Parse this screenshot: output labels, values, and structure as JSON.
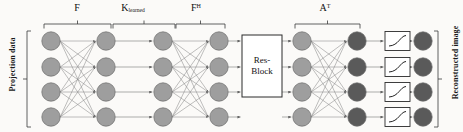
{
  "figure": {
    "type": "neural-network-architecture-diagram",
    "title": "",
    "background_color": "#fbfaf8"
  },
  "side_labels": {
    "left": "Projection data",
    "right": "Reconstructed image"
  },
  "operator_labels": [
    {
      "id": "F",
      "base": "F",
      "sub": "",
      "sup": "",
      "x": 77,
      "bracket_x1": 44,
      "bracket_x2": 111
    },
    {
      "id": "K",
      "base": "K",
      "sub": "learned",
      "sup": "",
      "x": 133,
      "bracket_x1": 113,
      "bracket_x2": 175
    },
    {
      "id": "FH",
      "base": "F",
      "sub": "",
      "sup": "H",
      "x": 196,
      "bracket_x1": 176,
      "bracket_x2": 225
    },
    {
      "id": "AT",
      "base": "A",
      "sub": "",
      "sup": "T",
      "x": 325,
      "bracket_x1": 295,
      "bracket_x2": 360
    }
  ],
  "blocks": {
    "res_block": {
      "line1": "Res-",
      "line2": "Block",
      "x": 242,
      "y": 35,
      "w": 40,
      "h": 62
    }
  },
  "node_columns": [
    {
      "id": "col-1",
      "x": 51,
      "color": "#9e9e9e",
      "count": 4
    },
    {
      "id": "col-2",
      "x": 106,
      "color": "#9e9e9e",
      "count": 4
    },
    {
      "id": "col-3",
      "x": 163,
      "color": "#9e9e9e",
      "count": 4
    },
    {
      "id": "col-4",
      "x": 219,
      "color": "#9e9e9e",
      "count": 4
    },
    {
      "id": "col-5",
      "x": 302,
      "color": "#9e9e9e",
      "count": 4
    },
    {
      "id": "col-6",
      "x": 357,
      "color": "#5a5a5a",
      "count": 4
    },
    {
      "id": "col-7",
      "x": 423,
      "color": "#5a5a5a",
      "count": 4
    }
  ],
  "node_rows_y": [
    41,
    67,
    92,
    117
  ],
  "activation_boxes": {
    "count": 4,
    "x": 385,
    "w": 25,
    "h": 19,
    "label": "activation-function"
  },
  "colors": {
    "node_light": "#9e9e9e",
    "node_dark": "#5a5a5a",
    "node_stroke": "#6b6b6b",
    "edge": "#8a8a8a",
    "box_stroke": "#2b2b2b",
    "text": "#111111",
    "bracket": "#3a3a3a"
  },
  "connection_groups": [
    {
      "id": "fc-1",
      "from": "col-1",
      "to": "col-2",
      "type": "fully-connected"
    },
    {
      "id": "straight-1",
      "from": "col-2",
      "to": "col-3",
      "type": "straight"
    },
    {
      "id": "fc-2",
      "from": "col-3",
      "to": "col-4",
      "type": "fully-connected"
    },
    {
      "id": "straight-2",
      "from": "col-4",
      "to": "res-block",
      "type": "straight"
    },
    {
      "id": "straight-3",
      "from": "res-block",
      "to": "col-5",
      "type": "straight"
    },
    {
      "id": "fc-3",
      "from": "col-5",
      "to": "col-6",
      "type": "fully-connected"
    },
    {
      "id": "straight-4",
      "from": "col-6",
      "to": "activation",
      "type": "straight"
    },
    {
      "id": "straight-5",
      "from": "activation",
      "to": "col-7",
      "type": "straight"
    }
  ]
}
